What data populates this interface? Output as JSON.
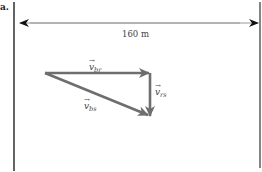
{
  "figure": {
    "part_label": "a.",
    "distance_label": "160 m",
    "vectors": [
      {
        "id": "v_br",
        "symbol": "v",
        "subscript": "br",
        "arrow": "→"
      },
      {
        "id": "v_rs",
        "symbol": "v",
        "subscript": "rs",
        "arrow": "→"
      },
      {
        "id": "v_bs",
        "symbol": "v",
        "subscript": "bs",
        "arrow": "→"
      }
    ],
    "colors": {
      "boundary_line": "#222222",
      "dimension_arrow": "#999999",
      "dimension_arrowhead": "#111111",
      "vector": "#6e6e6e"
    }
  }
}
